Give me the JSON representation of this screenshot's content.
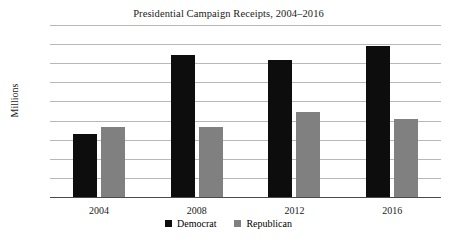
{
  "chart_data": {
    "type": "bar",
    "title": "Presidential Campaign Receipts, 2004–2016",
    "xlabel": "",
    "ylabel": "Millions",
    "ylim": [
      0,
      900
    ],
    "ytick_step": 100,
    "yticks": [
      "900",
      "800",
      "700",
      "600",
      "500",
      "400",
      "300",
      "200",
      "100",
      "0"
    ],
    "grid": true,
    "legend_position": "bottom-center",
    "categories": [
      "2004",
      "2008",
      "2012",
      "2016"
    ],
    "series": [
      {
        "name": "Democrat",
        "color": "#0d0d0d",
        "values": [
          330,
          745,
          715,
          790
        ]
      },
      {
        "name": "Republican",
        "color": "#808080",
        "values": [
          367,
          368,
          446,
          408
        ]
      }
    ]
  }
}
